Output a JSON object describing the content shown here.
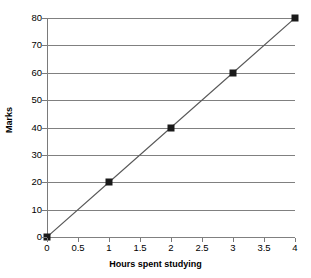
{
  "chart_data": {
    "type": "line",
    "title": "",
    "xlabel": "Hours spent studying",
    "ylabel": "Marks",
    "x": [
      0,
      1,
      2,
      3,
      4
    ],
    "values": [
      0,
      20,
      40,
      60,
      80
    ],
    "series": [
      {
        "name": "Marks",
        "x": [
          0,
          1,
          2,
          3,
          4
        ],
        "values": [
          0,
          20,
          40,
          60,
          80
        ]
      }
    ],
    "xlim": [
      0,
      4
    ],
    "ylim": [
      0,
      80
    ],
    "x_ticks": [
      0,
      0.5,
      1,
      1.5,
      2,
      2.5,
      3,
      3.5,
      4
    ],
    "x_tick_labels": [
      "0",
      "0.5",
      "1",
      "1.5",
      "2",
      "2.5",
      "3",
      "3.5",
      "4"
    ],
    "y_ticks": [
      0,
      10,
      20,
      30,
      40,
      50,
      60,
      70,
      80
    ],
    "y_tick_labels": [
      "0",
      "10",
      "20",
      "30",
      "40",
      "50",
      "60",
      "70",
      "80"
    ],
    "grid": "horizontal",
    "legend": "none",
    "marker": "filled-square",
    "marker_color": "#1a1a1a",
    "line_color": "#595959",
    "gridline_color": "#808080",
    "axis_color": "#7a7a7a",
    "background_color": "#ffffff"
  }
}
